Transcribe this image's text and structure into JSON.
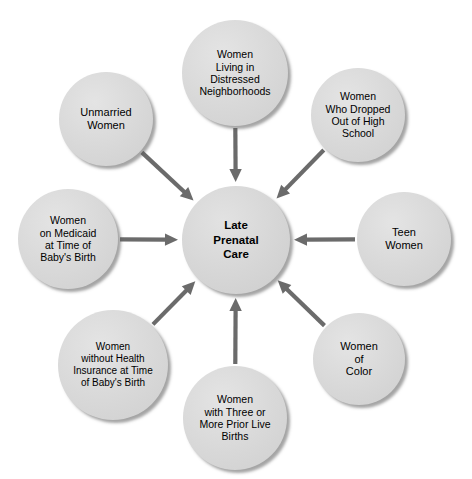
{
  "diagram": {
    "type": "hub-and-spoke",
    "canvas": {
      "width": 472,
      "height": 479,
      "background": "#ffffff"
    },
    "colors": {
      "node_fill": "#d9d9d9",
      "node_shadow": "#5a5a5a",
      "arrow": "#6b6b6b",
      "text": "#000000"
    },
    "center": {
      "id": "late-prenatal-care",
      "label": "Late Prenatal Care",
      "lines": [
        "Late",
        "Prenatal",
        "Care"
      ],
      "cx": 236,
      "cy": 240,
      "r": 54
    },
    "nodes": [
      {
        "id": "women-living-in-distressed-neighborhoods",
        "label": "Women Living in Distressed Neighborhoods",
        "lines": [
          "Women",
          "Living in",
          "Distressed",
          "Neighborhoods"
        ],
        "cx": 235,
        "cy": 73,
        "r": 53,
        "font_size": 10.5
      },
      {
        "id": "women-who-dropped-out-of-high-school",
        "label": "Women Who Dropped Out of High School",
        "lines": [
          "Women",
          "Who Dropped",
          "Out of High",
          "School"
        ],
        "cx": 358,
        "cy": 115,
        "r": 47,
        "font_size": 10.5
      },
      {
        "id": "teen-women",
        "label": "Teen Women",
        "lines": [
          "Teen",
          "Women"
        ],
        "cx": 404,
        "cy": 239,
        "r": 47,
        "font_size": 11
      },
      {
        "id": "women-of-color",
        "label": "Women of Color",
        "lines": [
          "Women",
          "of",
          "Color"
        ],
        "cx": 359,
        "cy": 359,
        "r": 46,
        "font_size": 11
      },
      {
        "id": "women-with-three-or-more-prior-live-births",
        "label": "Women with Three or More Prior Live Births",
        "lines": [
          "Women",
          "with Three or",
          "More Prior Live",
          "Births"
        ],
        "cx": 235,
        "cy": 418,
        "r": 52,
        "font_size": 10.5
      },
      {
        "id": "women-without-health-insurance-at-time-of-babys-birth",
        "label": "Women without Health Insurance at Time of Baby's Birth",
        "lines": [
          "Women",
          "without Health",
          "Insurance at Time",
          "of Baby's Birth"
        ],
        "cx": 113,
        "cy": 365,
        "r": 55,
        "font_size": 10
      },
      {
        "id": "women-on-medicaid-at-time-of-babys-birth",
        "label": "Women on Medicaid at Time of Baby's Birth",
        "lines": [
          "Women",
          "on Medicaid",
          "at Time of",
          "Baby's Birth"
        ],
        "cx": 68,
        "cy": 239,
        "r": 50,
        "font_size": 10.5
      },
      {
        "id": "unmarried-women",
        "label": "Unmarried Women",
        "lines": [
          "Unmarried",
          "Women"
        ],
        "cx": 106,
        "cy": 119,
        "r": 47,
        "font_size": 11
      }
    ],
    "arrows": [
      {
        "from": "women-living-in-distressed-neighborhoods",
        "to": "late-prenatal-care",
        "direction": "inward"
      },
      {
        "from": "women-who-dropped-out-of-high-school",
        "to": "late-prenatal-care",
        "direction": "inward"
      },
      {
        "from": "teen-women",
        "to": "late-prenatal-care",
        "direction": "inward"
      },
      {
        "from": "women-of-color",
        "to": "late-prenatal-care",
        "direction": "inward"
      },
      {
        "from": "women-with-three-or-more-prior-live-births",
        "to": "late-prenatal-care",
        "direction": "inward"
      },
      {
        "from": "women-without-health-insurance-at-time-of-babys-birth",
        "to": "late-prenatal-care",
        "direction": "inward"
      },
      {
        "from": "women-on-medicaid-at-time-of-babys-birth",
        "to": "late-prenatal-care",
        "direction": "inward"
      },
      {
        "from": "unmarried-women",
        "to": "late-prenatal-care",
        "direction": "inward"
      }
    ]
  }
}
